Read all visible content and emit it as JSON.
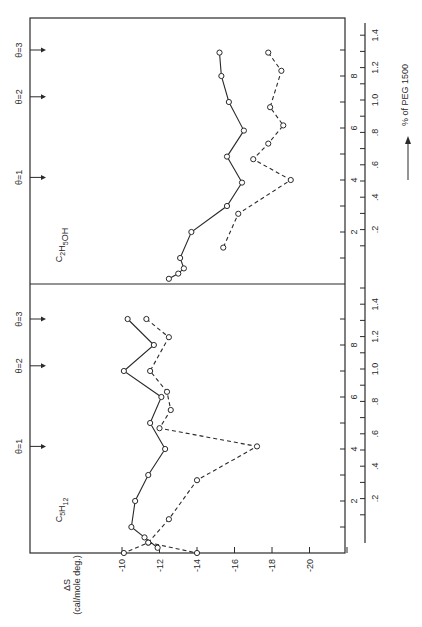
{
  "chart_data": {
    "type": "line",
    "orientation_note": "figure rotated 90 degrees counter-clockwise",
    "xlabel": "% of PEG 1500",
    "ylabel": "ΔS",
    "ylabel_units": "(cal/mole deg.)",
    "y_ticks": [
      "-10",
      "-12",
      "-14",
      "-16",
      "-18",
      "-20"
    ],
    "ylim": [
      -8,
      -22
    ],
    "x_inner_ticks": [
      "2",
      "4",
      "6",
      "8"
    ],
    "x_outer_ticks": [
      ".2",
      ".4",
      ".6",
      ".8",
      "1.0",
      "1.2",
      "1.4"
    ],
    "xlim": [
      0,
      10
    ],
    "theta_markers": [
      {
        "label": "θ=1",
        "x": 4.1
      },
      {
        "label": "θ=2",
        "x": 7.2
      },
      {
        "label": "θ=3",
        "x": 9.0
      }
    ],
    "panels": [
      {
        "name": "C5H12",
        "label_main": "C",
        "label_sub1": "5",
        "label_mid": "H",
        "label_sub2": "12",
        "series": [
          {
            "name": "solid",
            "style": "solid",
            "x": [
              9.0,
              8.0,
              7.0,
              6.0,
              5.0,
              4.0,
              3.0,
              2.0,
              1.0,
              0.6,
              0.2
            ],
            "y": [
              -10.3,
              -11.7,
              -10.1,
              -12.1,
              -11.5,
              -12.3,
              -11.4,
              -10.7,
              -10.5,
              -11.2,
              -11.9
            ]
          },
          {
            "name": "dashed",
            "style": "dashed",
            "x": [
              9.0,
              8.3,
              7.0,
              6.2,
              5.5,
              4.8,
              4.1,
              2.8,
              1.3,
              0.4,
              0.0
            ],
            "y": [
              -11.3,
              -12.5,
              -11.5,
              -12.4,
              -12.6,
              -12.0,
              -17.2,
              -14.0,
              -12.5,
              -11.4,
              -10.1
            ]
          },
          {
            "name": "dashed-end",
            "style": "dashed",
            "x": [
              0.4,
              0.0
            ],
            "y": [
              -11.4,
              -14.0
            ]
          }
        ]
      },
      {
        "name": "C2H5OH",
        "label_main": "C",
        "label_sub1": "2",
        "label_mid": "H",
        "label_sub2": "5",
        "label_tail": "OH",
        "series": [
          {
            "name": "solid",
            "style": "solid",
            "x": [
              8.9,
              8.0,
              7.0,
              5.9,
              4.9,
              3.9,
              3.0,
              2.0,
              1.0,
              0.6,
              0.4,
              0.2
            ],
            "y": [
              -15.2,
              -15.3,
              -15.7,
              -16.5,
              -15.6,
              -16.4,
              -15.6,
              -13.7,
              -13.1,
              -13.3,
              -13.0,
              -12.5
            ]
          },
          {
            "name": "dashed",
            "style": "dashed",
            "x": [
              8.9,
              8.2,
              6.8,
              6.1,
              5.4,
              4.8,
              4.0,
              2.7,
              1.4
            ],
            "y": [
              -17.8,
              -18.5,
              -17.9,
              -18.6,
              -17.8,
              -17.0,
              -19.0,
              -16.2,
              -15.4
            ]
          }
        ]
      }
    ]
  }
}
